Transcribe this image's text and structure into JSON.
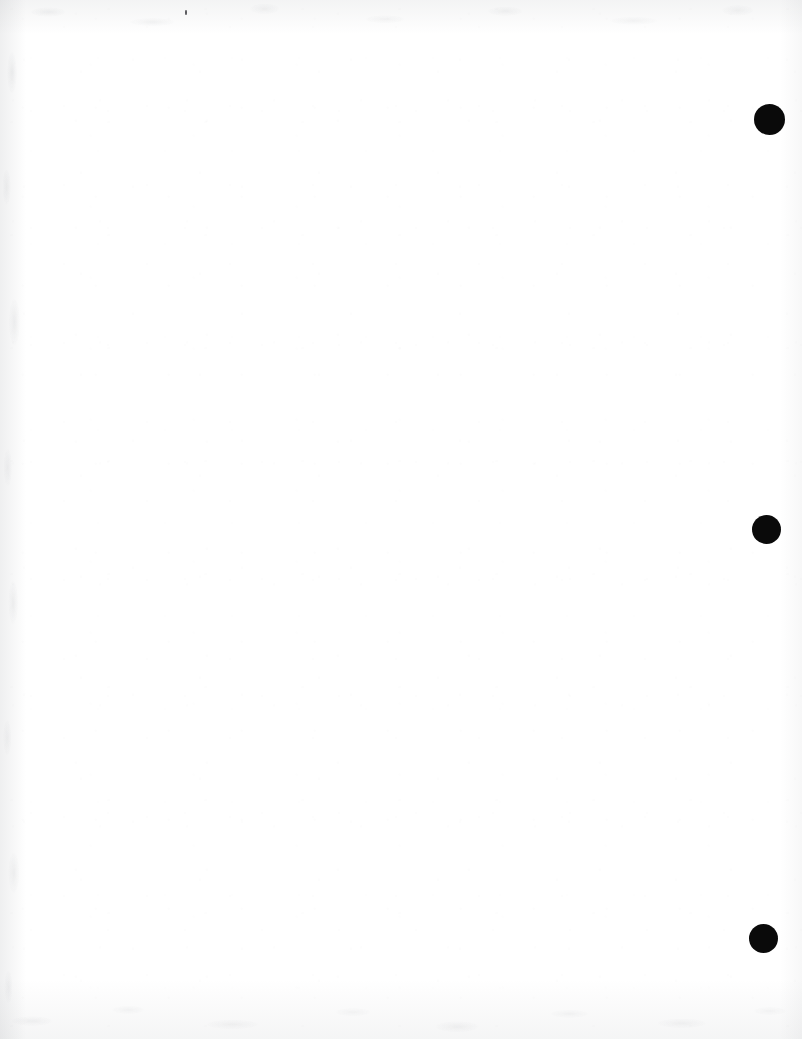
{
  "page": {
    "label": "scanned-blank-page",
    "width": 802,
    "height": 1039,
    "background_color": "#ffffff",
    "body_text": "",
    "caption": ""
  },
  "marks": {
    "ink_color": "#0a0a0a",
    "count": 3,
    "dots": [
      {
        "name": "registration-dot-top",
        "cx": 769,
        "cy": 119,
        "d": 31
      },
      {
        "name": "registration-dot-middle",
        "cx": 766,
        "cy": 529,
        "d": 29
      },
      {
        "name": "registration-dot-bottom",
        "cx": 763,
        "cy": 938,
        "d": 29
      }
    ]
  },
  "artifacts": {
    "specks": [
      {
        "name": "scan-speck-top",
        "x": 185,
        "y": 10,
        "w": 2,
        "h": 5
      }
    ],
    "edge_tone_color": "#6e727a"
  }
}
